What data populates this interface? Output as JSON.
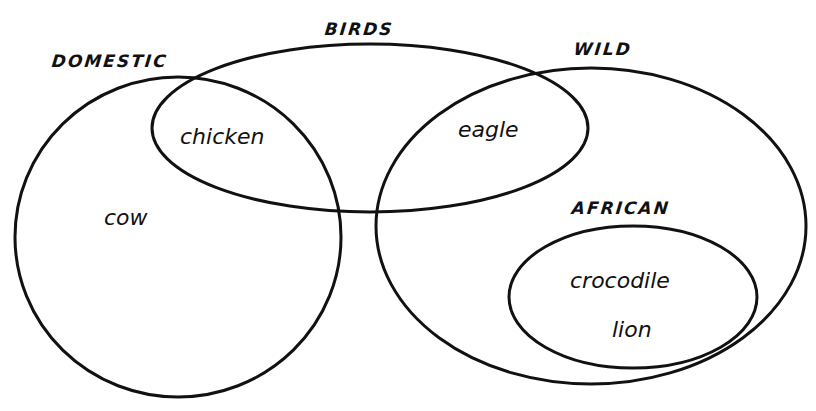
{
  "diagram": {
    "type": "venn",
    "stroke_color": "#111111",
    "background_color": "#ffffff",
    "sets": [
      {
        "id": "domestic",
        "label": "DOMESTIC",
        "shape": {
          "cx": 178,
          "cy": 237,
          "rx": 163,
          "ry": 160
        }
      },
      {
        "id": "birds",
        "label": "BIRDS",
        "shape": {
          "cx": 370,
          "cy": 128,
          "rx": 218,
          "ry": 84
        }
      },
      {
        "id": "wild",
        "label": "WILD",
        "shape": {
          "cx": 591,
          "cy": 226,
          "rx": 215,
          "ry": 158
        }
      },
      {
        "id": "african",
        "label": "AFRICAN",
        "shape": {
          "cx": 633,
          "cy": 297,
          "rx": 124,
          "ry": 71
        },
        "subset_of": "wild"
      }
    ],
    "members": [
      {
        "label": "chicken",
        "in_sets": [
          "domestic",
          "birds"
        ]
      },
      {
        "label": "eagle",
        "in_sets": [
          "birds",
          "wild"
        ]
      },
      {
        "label": "cow",
        "in_sets": [
          "domestic"
        ]
      },
      {
        "label": "crocodile",
        "in_sets": [
          "wild",
          "african"
        ]
      },
      {
        "label": "lion",
        "in_sets": [
          "wild",
          "african"
        ]
      }
    ]
  },
  "labels": {
    "domestic": "DOMESTIC",
    "birds": "BIRDS",
    "wild": "WILD",
    "african": "AFRICAN",
    "chicken": "chicken",
    "eagle": "eagle",
    "cow": "cow",
    "crocodile": "crocodile",
    "lion": "lion"
  }
}
